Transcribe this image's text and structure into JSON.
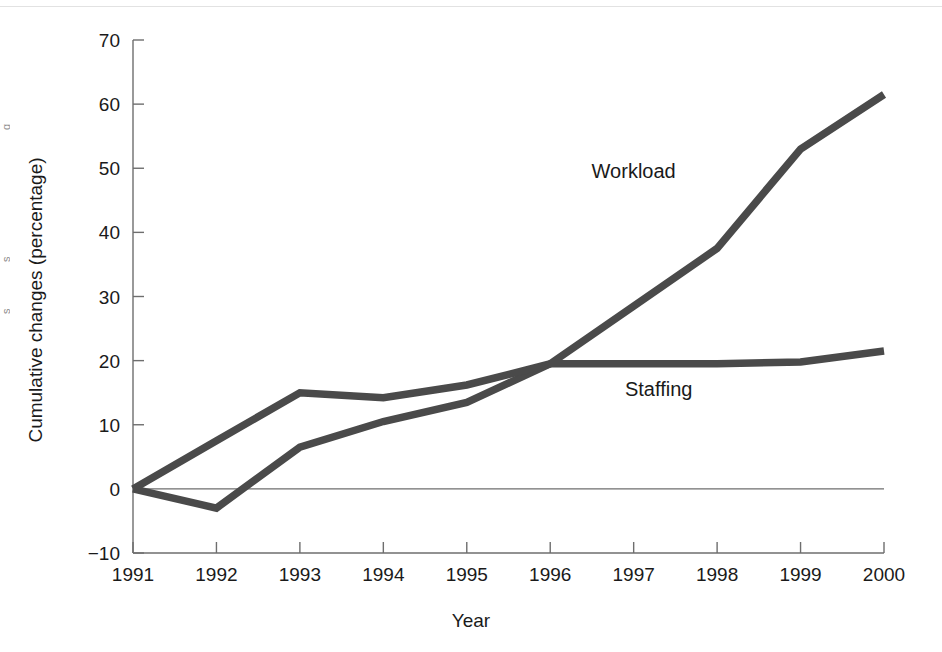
{
  "figure": {
    "edge_fragments": [
      "g",
      "s",
      "s"
    ]
  },
  "chart_data": {
    "type": "line",
    "title": "",
    "xlabel": "Year",
    "ylabel": "Cumulative changes (percentage)",
    "categories": [
      "1991",
      "1992",
      "1993",
      "1994",
      "1995",
      "1996",
      "1997",
      "1998",
      "1999",
      "2000"
    ],
    "x": [
      1991,
      1992,
      1993,
      1994,
      1995,
      1996,
      1997,
      1998,
      1999,
      2000
    ],
    "xlim": [
      1991,
      2000
    ],
    "ylim": [
      -10,
      70
    ],
    "yticks": [
      -10,
      0,
      10,
      20,
      30,
      40,
      50,
      60,
      70
    ],
    "ytick_labels": [
      "−10",
      "0",
      "10",
      "20",
      "30",
      "40",
      "50",
      "60",
      "70"
    ],
    "xtick_labels": [
      "1991",
      "1992",
      "1993",
      "1994",
      "1995",
      "1996",
      "1997",
      "1998",
      "1999",
      "2000"
    ],
    "grid": false,
    "legend_position": "inline-annotations",
    "zero_reference_line": true,
    "series": [
      {
        "name": "Workload",
        "color": "#4a4a4a",
        "label_position": {
          "x": 1997.0,
          "y": 48.5
        },
        "values": [
          0,
          -3,
          6.5,
          10.5,
          13.5,
          19.5,
          28.5,
          37.5,
          53,
          61.5
        ]
      },
      {
        "name": "Staffing",
        "color": "#4a4a4a",
        "label_position": {
          "x": 1997.3,
          "y": 14.5
        },
        "values": [
          0,
          7.5,
          15,
          14.2,
          16.2,
          19.5,
          19.5,
          19.5,
          19.8,
          21.5
        ]
      }
    ],
    "annotations": [
      {
        "text": "Workload",
        "x": 1997.0,
        "y": 48.5
      },
      {
        "text": "Staffing",
        "x": 1997.3,
        "y": 14.5
      }
    ]
  }
}
